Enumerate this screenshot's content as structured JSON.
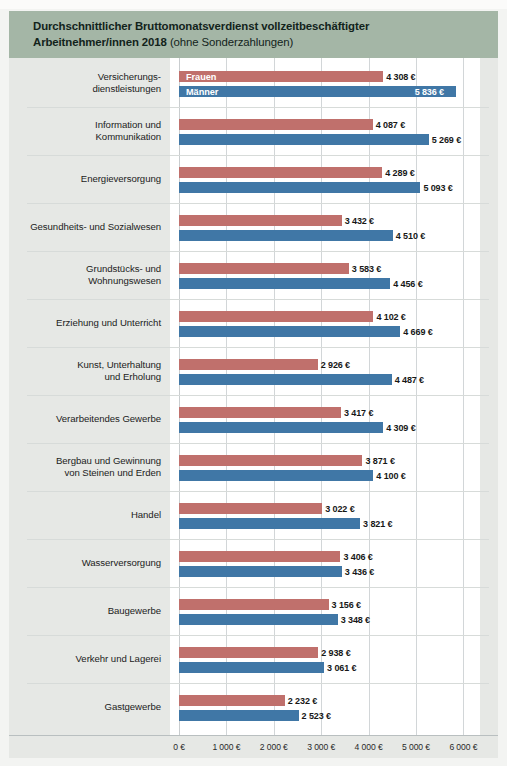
{
  "header": {
    "title_bold": "Durchschnittlicher Bruttomonatsverdienst vollzeitbeschäftigter Arbeitnehmer/innen 2018",
    "title_line1": "Durchschnittlicher Bruttomonatsverdienst vollzeitbeschäftigter",
    "title_line2": "Arbeitnehmer/innen 2018",
    "title_note": " (ohne Sonderzahlungen)",
    "band_color": "#a4b6a6"
  },
  "legend": {
    "frauen_label": "Frauen",
    "maenner_label": "Männer",
    "frauen_color": "#c0706c",
    "maenner_color": "#4077a6"
  },
  "chart_data": {
    "type": "bar",
    "orientation": "horizontal",
    "title": "Durchschnittlicher Bruttomonatsverdienst vollzeitbeschäftigter Arbeitnehmer/innen 2018 (ohne Sonderzahlungen)",
    "xlabel": "",
    "ylabel": "",
    "xlim": [
      0,
      6000
    ],
    "grid": true,
    "legend_position": "inside-first-bars",
    "xticks": [
      0,
      1000,
      2000,
      3000,
      4000,
      5000,
      6000
    ],
    "xtick_labels": [
      "0 €",
      "1 000 €",
      "2 000 €",
      "3 000 €",
      "4 000 €",
      "5 000 €",
      "6 000 €"
    ],
    "categories": [
      "Versicherungs-\ndienstleistungen",
      "Information und\nKommunikation",
      "Energieversorgung",
      "Gesundheits- und Sozialwesen",
      "Grundstücks- und\nWohnungswesen",
      "Erziehung und Unterricht",
      "Kunst, Unterhaltung\nund Erholung",
      "Verarbeitendes Gewerbe",
      "Bergbau und Gewinnung\nvon Steinen und Erden",
      "Handel",
      "Wasserversorgung",
      "Baugewerbe",
      "Verkehr und Lagerei",
      "Gastgewerbe"
    ],
    "series": [
      {
        "name": "Frauen",
        "color": "#c0706c",
        "values": [
          4308,
          4087,
          4289,
          3432,
          3583,
          4102,
          2926,
          3417,
          3871,
          3022,
          3406,
          3156,
          2938,
          2232
        ]
      },
      {
        "name": "Männer",
        "color": "#4077a6",
        "values": [
          5836,
          5269,
          5093,
          4510,
          4456,
          4669,
          4487,
          4309,
          4100,
          3821,
          3436,
          3348,
          3061,
          2523
        ]
      }
    ]
  },
  "rows": [
    {
      "label_lines": [
        "Versicherungs-",
        "dienstleistungen"
      ],
      "frauen": {
        "value": 4308,
        "label": "4 308 €",
        "legend": "Frauen",
        "inside": false
      },
      "maenner": {
        "value": 5836,
        "label": "5 836 €",
        "legend": "Männer",
        "inside": true
      }
    },
    {
      "label_lines": [
        "Information und",
        "Kommunikation"
      ],
      "frauen": {
        "value": 4087,
        "label": "4 087 €",
        "inside": false
      },
      "maenner": {
        "value": 5269,
        "label": "5 269 €",
        "inside": false
      }
    },
    {
      "label_lines": [
        "Energieversorgung"
      ],
      "frauen": {
        "value": 4289,
        "label": "4 289 €",
        "inside": false
      },
      "maenner": {
        "value": 5093,
        "label": "5 093 €",
        "inside": false
      }
    },
    {
      "label_lines": [
        "Gesundheits- und Sozialwesen"
      ],
      "frauen": {
        "value": 3432,
        "label": "3 432 €",
        "inside": false
      },
      "maenner": {
        "value": 4510,
        "label": "4 510 €",
        "inside": false
      }
    },
    {
      "label_lines": [
        "Grundstücks- und",
        "Wohnungswesen"
      ],
      "frauen": {
        "value": 3583,
        "label": "3 583 €",
        "inside": false
      },
      "maenner": {
        "value": 4456,
        "label": "4 456 €",
        "inside": false
      }
    },
    {
      "label_lines": [
        "Erziehung und Unterricht"
      ],
      "frauen": {
        "value": 4102,
        "label": "4 102 €",
        "inside": false
      },
      "maenner": {
        "value": 4669,
        "label": "4 669 €",
        "inside": false
      }
    },
    {
      "label_lines": [
        "Kunst, Unterhaltung",
        "und Erholung"
      ],
      "frauen": {
        "value": 2926,
        "label": "2 926 €",
        "inside": false
      },
      "maenner": {
        "value": 4487,
        "label": "4 487 €",
        "inside": false
      }
    },
    {
      "label_lines": [
        "Verarbeitendes Gewerbe"
      ],
      "frauen": {
        "value": 3417,
        "label": "3 417 €",
        "inside": false
      },
      "maenner": {
        "value": 4309,
        "label": "4 309 €",
        "inside": false
      }
    },
    {
      "label_lines": [
        "Bergbau und Gewinnung",
        "von Steinen und Erden"
      ],
      "frauen": {
        "value": 3871,
        "label": "3 871 €",
        "inside": false
      },
      "maenner": {
        "value": 4100,
        "label": "4 100 €",
        "inside": false
      }
    },
    {
      "label_lines": [
        "Handel"
      ],
      "frauen": {
        "value": 3022,
        "label": "3 022 €",
        "inside": false
      },
      "maenner": {
        "value": 3821,
        "label": "3 821 €",
        "inside": false
      }
    },
    {
      "label_lines": [
        "Wasserversorgung"
      ],
      "frauen": {
        "value": 3406,
        "label": "3 406 €",
        "inside": false
      },
      "maenner": {
        "value": 3436,
        "label": "3 436 €",
        "inside": false
      }
    },
    {
      "label_lines": [
        "Baugewerbe"
      ],
      "frauen": {
        "value": 3156,
        "label": "3 156 €",
        "inside": false
      },
      "maenner": {
        "value": 3348,
        "label": "3 348 €",
        "inside": false
      }
    },
    {
      "label_lines": [
        "Verkehr und Lagerei"
      ],
      "frauen": {
        "value": 2938,
        "label": "2 938 €",
        "inside": false
      },
      "maenner": {
        "value": 3061,
        "label": "3 061 €",
        "inside": false
      }
    },
    {
      "label_lines": [
        "Gastgewerbe"
      ],
      "frauen": {
        "value": 2232,
        "label": "2 232 €",
        "inside": false
      },
      "maenner": {
        "value": 2523,
        "label": "2 523 €",
        "inside": false
      }
    }
  ]
}
